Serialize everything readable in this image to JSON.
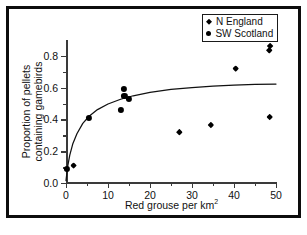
{
  "figure": {
    "caption": ""
  },
  "legend": {
    "position": "top-right",
    "entries": [
      {
        "label": "N England",
        "marker": "diamond",
        "color": "#000000"
      },
      {
        "label": "SW Scotland",
        "marker": "circle",
        "color": "#000000"
      }
    ]
  },
  "chart_data": {
    "type": "scatter",
    "title": "",
    "subtitle": "",
    "xlabel": "Red grouse per km²",
    "ylabel": "Proportion of pellets containing gamebirds",
    "ylabel_line1": "Proportion of pellets",
    "ylabel_line2": "containing gamebirds",
    "xlim": [
      0,
      50
    ],
    "ylim": [
      0,
      0.9
    ],
    "grid": false,
    "legend_position": "top-right",
    "xticks": [
      0,
      10,
      20,
      30,
      40,
      50
    ],
    "xtick_labels": [
      "0",
      "10",
      "20",
      "30",
      "40",
      "50"
    ],
    "x_minor_ticks": [
      5,
      15,
      25,
      35,
      45
    ],
    "yticks": [
      0.0,
      0.2,
      0.4,
      0.6,
      0.8
    ],
    "ytick_labels": [
      "0.0",
      "0.2",
      "0.4",
      "0.6",
      "0.8"
    ],
    "y_minor_ticks": [
      0.1,
      0.3,
      0.5,
      0.7
    ],
    "series": [
      {
        "name": "N England",
        "marker": "diamond",
        "color": "#000000",
        "points": [
          {
            "x": 1.8,
            "y": 0.11
          },
          {
            "x": 27.0,
            "y": 0.32
          },
          {
            "x": 34.5,
            "y": 0.365
          },
          {
            "x": 40.4,
            "y": 0.72
          },
          {
            "x": 48.5,
            "y": 0.415
          },
          {
            "x": 48.4,
            "y": 0.835
          },
          {
            "x": 48.6,
            "y": 0.862
          }
        ]
      },
      {
        "name": "SW Scotland",
        "marker": "circle",
        "color": "#000000",
        "points": [
          {
            "x": 0.3,
            "y": 0.088
          },
          {
            "x": 5.5,
            "y": 0.412
          },
          {
            "x": 13.0,
            "y": 0.462
          },
          {
            "x": 13.8,
            "y": 0.592
          },
          {
            "x": 13.9,
            "y": 0.548
          },
          {
            "x": 14.9,
            "y": 0.528
          }
        ]
      }
    ],
    "fit_curve": {
      "name": "fitted curve",
      "color": "#111111",
      "description": "asymptotic / logarithmic fit rising steeply from origin then flattening near 0.62",
      "x": [
        0.0,
        0.4,
        0.9,
        1.6,
        2.6,
        4.0,
        5.5,
        7.5,
        10.0,
        13.0,
        16.0,
        20.0,
        25.0,
        30.0,
        35.0,
        40.0,
        45.0,
        50.0
      ],
      "y": [
        0.015,
        0.105,
        0.175,
        0.245,
        0.31,
        0.375,
        0.42,
        0.462,
        0.497,
        0.527,
        0.549,
        0.57,
        0.589,
        0.601,
        0.61,
        0.616,
        0.62,
        0.623
      ]
    }
  }
}
